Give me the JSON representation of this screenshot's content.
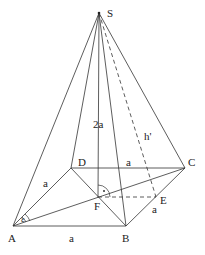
{
  "diagram": {
    "vertices": {
      "S": {
        "label": "S",
        "x": 99,
        "y": 13
      },
      "A": {
        "label": "A",
        "x": 13,
        "y": 226
      },
      "B": {
        "label": "B",
        "x": 126,
        "y": 226
      },
      "C": {
        "label": "C",
        "x": 185,
        "y": 168
      },
      "D": {
        "label": "D",
        "x": 71,
        "y": 168
      },
      "F": {
        "label": "F",
        "x": 98,
        "y": 197
      },
      "E": {
        "label": "E",
        "x": 156,
        "y": 197
      }
    },
    "labels": {
      "height": "2a",
      "slant_height": "h'",
      "side_AB": "a",
      "side_AD": "a",
      "side_DC": "a",
      "side_BC": "a",
      "angle": "ε",
      "right_angle_dot": "·"
    },
    "edges_solid": [
      "SA",
      "SB",
      "SC",
      "SD",
      "SF",
      "AB",
      "BC",
      "CD",
      "DA",
      "AC",
      "DB"
    ],
    "edges_dashed": [
      "SE",
      "FE"
    ],
    "stroke_color": "#333333"
  }
}
